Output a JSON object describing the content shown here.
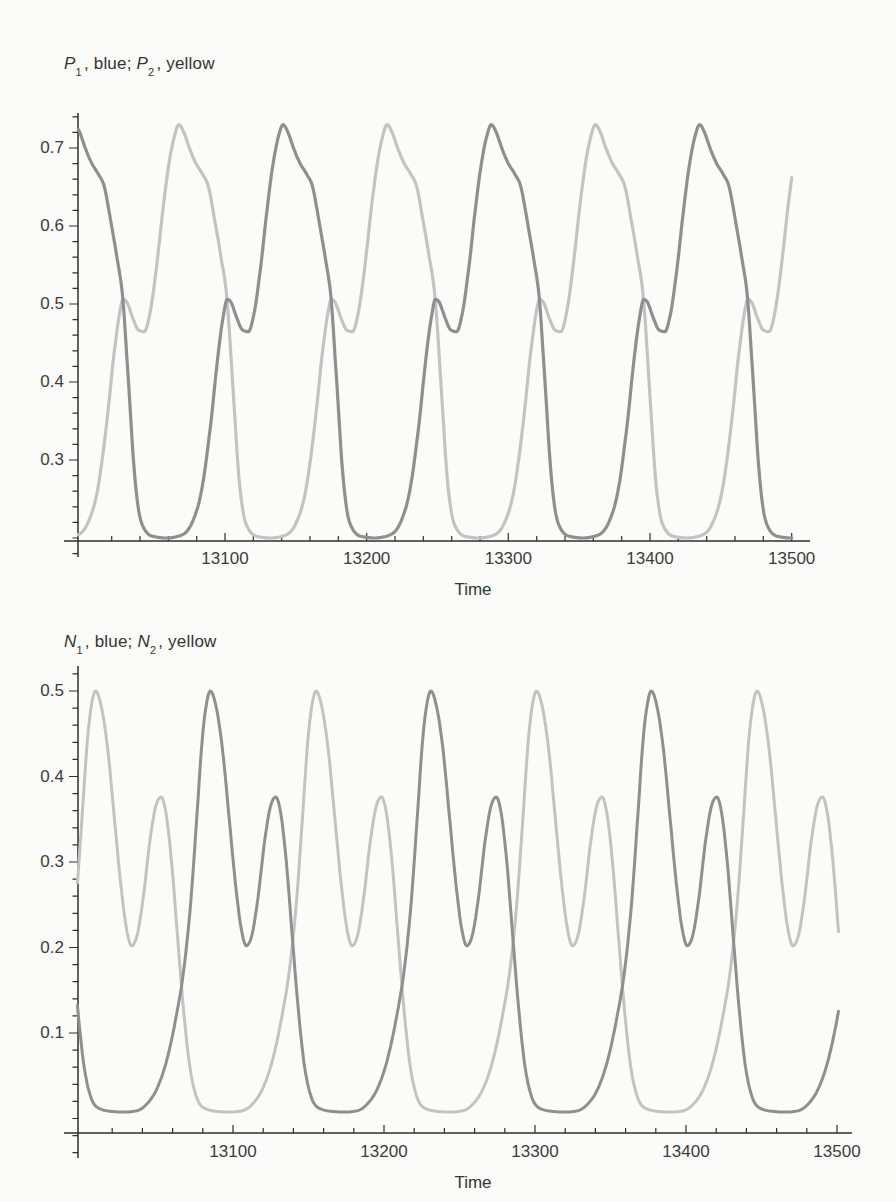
{
  "page": {
    "background": "#fbfbfa",
    "axis_color": "#2f2f2f",
    "text_color": "#3c3c3c"
  },
  "chart_data": [
    {
      "type": "line",
      "title_parts": {
        "var1": "P",
        "sub1": "1",
        "mid": ", blue; ",
        "var2": "P",
        "sub2": "2",
        "end": ", yellow"
      },
      "title_plain": "P1, blue; P2, yellow",
      "xlabel": "Time",
      "x_axis": {
        "ticks_major": [
          13100,
          13200,
          13300,
          13400,
          13500
        ],
        "minor_start": 13020,
        "minor_step": 20,
        "minor_end": 13500,
        "range": [
          12996,
          13513
        ]
      },
      "y_axis": {
        "ticks_major": [
          0.3,
          0.4,
          0.5,
          0.6,
          0.7
        ],
        "minor_start": 0.18,
        "minor_step": 0.02,
        "minor_end": 0.74,
        "range": [
          0.196,
          0.744
        ]
      },
      "legend_position": "title",
      "grid": false,
      "period_approx": 147,
      "series": [
        {
          "name": "P1",
          "legend_color_word": "blue",
          "color": "#8f8f8f",
          "stroke_width": 3.2,
          "period": 147,
          "peak_time_ref": 13141,
          "t_start": 12996.5,
          "t_end": 13500,
          "peak_value": 0.73,
          "small_peak_value": 0.51,
          "min_value": 0.2,
          "waveform_phase_value": [
            [
              0.0,
              0.73
            ],
            [
              0.022,
              0.721
            ],
            [
              0.05,
              0.7
            ],
            [
              0.08,
              0.681
            ],
            [
              0.112,
              0.667
            ],
            [
              0.142,
              0.65
            ],
            [
              0.172,
              0.607
            ],
            [
              0.202,
              0.56
            ],
            [
              0.23,
              0.508
            ],
            [
              0.258,
              0.398
            ],
            [
              0.288,
              0.278
            ],
            [
              0.322,
              0.218
            ],
            [
              0.37,
              0.2025
            ],
            [
              0.44,
              0.2
            ],
            [
              0.51,
              0.2035
            ],
            [
              0.562,
              0.219
            ],
            [
              0.61,
              0.263
            ],
            [
              0.652,
              0.345
            ],
            [
              0.69,
              0.44
            ],
            [
              0.715,
              0.488
            ],
            [
              0.731,
              0.506
            ],
            [
              0.748,
              0.503
            ],
            [
              0.778,
              0.482
            ],
            [
              0.806,
              0.4665
            ],
            [
              0.833,
              0.4645
            ],
            [
              0.862,
              0.49
            ],
            [
              0.893,
              0.549
            ],
            [
              0.923,
              0.621
            ],
            [
              0.952,
              0.68
            ],
            [
              0.977,
              0.714
            ]
          ]
        },
        {
          "name": "P2",
          "legend_color_word": "yellow",
          "color": "#c3c3c3",
          "stroke_width": 3.2,
          "period": 147,
          "peak_time_ref": 13067.5,
          "t_start": 12996.5,
          "t_end": 13500,
          "peak_value": 0.73,
          "small_peak_value": 0.51,
          "min_value": 0.2,
          "waveform_phase_value": [
            [
              0.0,
              0.73
            ],
            [
              0.022,
              0.721
            ],
            [
              0.05,
              0.7
            ],
            [
              0.08,
              0.681
            ],
            [
              0.112,
              0.667
            ],
            [
              0.142,
              0.65
            ],
            [
              0.172,
              0.607
            ],
            [
              0.202,
              0.56
            ],
            [
              0.23,
              0.508
            ],
            [
              0.258,
              0.398
            ],
            [
              0.288,
              0.278
            ],
            [
              0.322,
              0.218
            ],
            [
              0.37,
              0.2025
            ],
            [
              0.44,
              0.2
            ],
            [
              0.51,
              0.2035
            ],
            [
              0.562,
              0.219
            ],
            [
              0.61,
              0.263
            ],
            [
              0.652,
              0.345
            ],
            [
              0.69,
              0.44
            ],
            [
              0.715,
              0.488
            ],
            [
              0.731,
              0.506
            ],
            [
              0.748,
              0.503
            ],
            [
              0.778,
              0.482
            ],
            [
              0.806,
              0.4665
            ],
            [
              0.833,
              0.4645
            ],
            [
              0.862,
              0.49
            ],
            [
              0.893,
              0.549
            ],
            [
              0.923,
              0.621
            ],
            [
              0.952,
              0.68
            ],
            [
              0.977,
              0.714
            ]
          ]
        }
      ]
    },
    {
      "type": "line",
      "title_parts": {
        "var1": "N",
        "sub1": "1",
        "mid": ", blue; ",
        "var2": "N",
        "sub2": "2",
        "end": ", yellow"
      },
      "title_plain": "N1, blue; N2, yellow",
      "xlabel": "Time",
      "x_axis": {
        "ticks_major": [
          13100,
          13200,
          13300,
          13400,
          13500
        ],
        "minor_start": 13020,
        "minor_step": 20,
        "minor_end": 13500,
        "range": [
          12997,
          13510
        ]
      },
      "y_axis": {
        "ticks_major": [
          0.1,
          0.2,
          0.3,
          0.4,
          0.5
        ],
        "minor_start": -0.04,
        "minor_step": 0.02,
        "minor_end": 0.52,
        "range": [
          -0.02,
          0.525
        ]
      },
      "legend_position": "title",
      "grid": false,
      "period_approx": 146,
      "series": [
        {
          "name": "N1",
          "legend_color_word": "blue",
          "color": "#8f8f8f",
          "stroke_width": 3.0,
          "period": 146,
          "peak_time_ref": 13085,
          "t_start": 12997,
          "t_end": 13501,
          "peak_value": 0.5,
          "small_peak_value": 0.375,
          "valley_value": 0.2,
          "min_value": 0.007,
          "waveform_phase_value": [
            [
              0.0,
              0.5
            ],
            [
              0.025,
              0.483
            ],
            [
              0.055,
              0.432
            ],
            [
              0.085,
              0.352
            ],
            [
              0.115,
              0.272
            ],
            [
              0.14,
              0.222
            ],
            [
              0.163,
              0.202
            ],
            [
              0.186,
              0.212
            ],
            [
              0.215,
              0.256
            ],
            [
              0.247,
              0.326
            ],
            [
              0.276,
              0.368
            ],
            [
              0.297,
              0.376
            ],
            [
              0.318,
              0.359
            ],
            [
              0.344,
              0.302
            ],
            [
              0.371,
              0.215
            ],
            [
              0.398,
              0.13
            ],
            [
              0.426,
              0.063
            ],
            [
              0.454,
              0.028
            ],
            [
              0.49,
              0.0125
            ],
            [
              0.545,
              0.0085
            ],
            [
              0.61,
              0.0075
            ],
            [
              0.665,
              0.009
            ],
            [
              0.712,
              0.017
            ],
            [
              0.758,
              0.035
            ],
            [
              0.802,
              0.068
            ],
            [
              0.844,
              0.118
            ],
            [
              0.88,
              0.175
            ],
            [
              0.911,
              0.253
            ],
            [
              0.94,
              0.358
            ],
            [
              0.963,
              0.443
            ],
            [
              0.981,
              0.483
            ]
          ]
        },
        {
          "name": "N2",
          "legend_color_word": "yellow",
          "color": "#c3c3c3",
          "stroke_width": 3.0,
          "period": 146,
          "peak_time_ref": 13009,
          "t_start": 12997,
          "t_end": 13501,
          "peak_value": 0.5,
          "small_peak_value": 0.375,
          "valley_value": 0.2,
          "min_value": 0.007,
          "waveform_phase_value": [
            [
              0.0,
              0.5
            ],
            [
              0.025,
              0.483
            ],
            [
              0.055,
              0.432
            ],
            [
              0.085,
              0.352
            ],
            [
              0.115,
              0.272
            ],
            [
              0.14,
              0.222
            ],
            [
              0.163,
              0.202
            ],
            [
              0.186,
              0.212
            ],
            [
              0.215,
              0.256
            ],
            [
              0.247,
              0.326
            ],
            [
              0.276,
              0.368
            ],
            [
              0.297,
              0.376
            ],
            [
              0.318,
              0.359
            ],
            [
              0.344,
              0.302
            ],
            [
              0.371,
              0.215
            ],
            [
              0.398,
              0.13
            ],
            [
              0.426,
              0.063
            ],
            [
              0.454,
              0.028
            ],
            [
              0.49,
              0.0125
            ],
            [
              0.545,
              0.0085
            ],
            [
              0.61,
              0.0075
            ],
            [
              0.665,
              0.009
            ],
            [
              0.712,
              0.017
            ],
            [
              0.758,
              0.035
            ],
            [
              0.802,
              0.068
            ],
            [
              0.844,
              0.118
            ],
            [
              0.88,
              0.175
            ],
            [
              0.911,
              0.253
            ],
            [
              0.94,
              0.358
            ],
            [
              0.963,
              0.443
            ],
            [
              0.981,
              0.483
            ]
          ]
        }
      ]
    }
  ]
}
